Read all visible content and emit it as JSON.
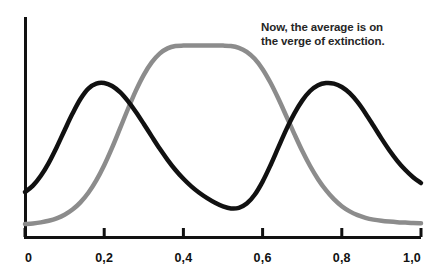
{
  "annotation": {
    "line1": "Now, the average is on",
    "line2": "the verge of extinction."
  },
  "axis": {
    "tick_labels": [
      "0",
      "0,2",
      "0,4",
      "0,6",
      "0,8",
      "1,0"
    ],
    "tick_values": [
      0,
      0.2,
      0.4,
      0.6,
      0.8,
      1.0
    ],
    "axis_color": "#111111"
  },
  "colors": {
    "bimodal_curve": "#111111",
    "unimodal_curve": "#8c8c8c",
    "background": "#ffffff",
    "text": "#262626"
  },
  "chart_data": {
    "type": "line",
    "title": "",
    "subtitle": "",
    "xlabel": "",
    "ylabel": "",
    "xlim": [
      0,
      1.0
    ],
    "ylim": [
      0,
      1.0
    ],
    "grid": false,
    "legend": false,
    "annotations": [
      {
        "text": "Now, the average is on the verge of extinction.",
        "x": 0.75,
        "y": 0.93
      }
    ],
    "xticks": [
      0,
      0.2,
      0.4,
      0.6,
      0.8,
      1.0
    ],
    "xticklabels": [
      "0",
      "0,2",
      "0,4",
      "0,6",
      "0,8",
      "1,0"
    ],
    "yticks": [],
    "yticklabels": [],
    "series": [
      {
        "name": "bimodal",
        "color": "#111111",
        "peaks": [
          {
            "x": 0.2,
            "y": 0.745
          },
          {
            "x": 0.79,
            "y": 0.745
          }
        ],
        "valley": {
          "x": 0.51,
          "y": 0.115
        },
        "x": [
          0.0,
          0.02,
          0.04,
          0.06,
          0.08,
          0.1,
          0.12,
          0.14,
          0.16,
          0.18,
          0.2,
          0.22,
          0.24,
          0.26,
          0.28,
          0.3,
          0.32,
          0.34,
          0.36,
          0.38,
          0.4,
          0.42,
          0.44,
          0.46,
          0.48,
          0.5,
          0.52,
          0.54,
          0.56,
          0.58,
          0.6,
          0.62,
          0.64,
          0.66,
          0.68,
          0.7,
          0.72,
          0.74,
          0.76,
          0.78,
          0.8,
          0.82,
          0.84,
          0.86,
          0.88,
          0.9,
          0.92,
          0.94,
          0.96,
          0.98,
          1.0
        ],
        "y": [
          0.2,
          0.232,
          0.281,
          0.346,
          0.424,
          0.509,
          0.592,
          0.665,
          0.717,
          0.742,
          0.745,
          0.73,
          0.699,
          0.654,
          0.6,
          0.54,
          0.478,
          0.417,
          0.361,
          0.31,
          0.266,
          0.228,
          0.196,
          0.169,
          0.146,
          0.128,
          0.118,
          0.121,
          0.142,
          0.186,
          0.252,
          0.334,
          0.424,
          0.513,
          0.592,
          0.657,
          0.705,
          0.734,
          0.745,
          0.742,
          0.725,
          0.694,
          0.649,
          0.593,
          0.531,
          0.468,
          0.409,
          0.356,
          0.311,
          0.274,
          0.245
        ]
      },
      {
        "name": "unimodal",
        "color": "#8c8c8c",
        "peaks": [
          {
            "x": 0.5,
            "y": 0.93
          }
        ],
        "x": [
          0.0,
          0.02,
          0.04,
          0.06,
          0.08,
          0.1,
          0.12,
          0.14,
          0.16,
          0.18,
          0.2,
          0.22,
          0.24,
          0.26,
          0.28,
          0.3,
          0.32,
          0.34,
          0.36,
          0.38,
          0.4,
          0.42,
          0.44,
          0.46,
          0.48,
          0.5,
          0.52,
          0.54,
          0.56,
          0.58,
          0.6,
          0.62,
          0.64,
          0.66,
          0.68,
          0.7,
          0.72,
          0.74,
          0.76,
          0.78,
          0.8,
          0.82,
          0.84,
          0.86,
          0.88,
          0.9,
          0.92,
          0.94,
          0.96,
          0.98,
          1.0
        ],
        "y": [
          0.04,
          0.043,
          0.048,
          0.056,
          0.068,
          0.086,
          0.112,
          0.148,
          0.196,
          0.258,
          0.334,
          0.422,
          0.518,
          0.615,
          0.707,
          0.786,
          0.848,
          0.892,
          0.918,
          0.93,
          0.932,
          0.932,
          0.932,
          0.932,
          0.932,
          0.932,
          0.93,
          0.921,
          0.901,
          0.866,
          0.814,
          0.746,
          0.666,
          0.579,
          0.491,
          0.406,
          0.33,
          0.264,
          0.209,
          0.164,
          0.129,
          0.103,
          0.084,
          0.071,
          0.062,
          0.056,
          0.052,
          0.049,
          0.047,
          0.045,
          0.044
        ]
      }
    ]
  }
}
